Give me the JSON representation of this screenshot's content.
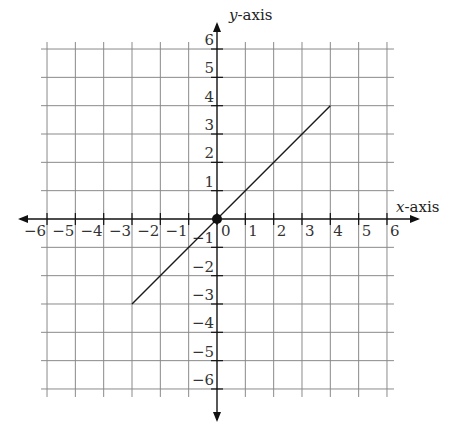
{
  "chart_data": {
    "type": "line",
    "title": "",
    "xlabel": "x-axis",
    "ylabel": "y-axis",
    "xlim": [
      -6,
      6
    ],
    "ylim": [
      -6,
      6
    ],
    "grid": true,
    "x_ticks": [
      -6,
      -5,
      -4,
      -3,
      -2,
      -1,
      0,
      1,
      2,
      3,
      4,
      5,
      6
    ],
    "y_ticks": [
      -6,
      -5,
      -4,
      -3,
      -2,
      -1,
      1,
      2,
      3,
      4,
      5,
      6
    ],
    "x_tick_labels": [
      "−6",
      "−5",
      "−4",
      "−3",
      "−2",
      "−1",
      "0",
      "1",
      "2",
      "3",
      "4",
      "5",
      "6"
    ],
    "y_tick_labels": [
      "−6",
      "−5",
      "−4",
      "−3",
      "−2",
      "−1",
      "1",
      "2",
      "3",
      "4",
      "5",
      "6"
    ],
    "series": [
      {
        "name": "line segment y = x",
        "x": [
          -3,
          4
        ],
        "y": [
          -3,
          4
        ]
      }
    ],
    "points": [
      {
        "label": "origin",
        "x": 0,
        "y": 0
      }
    ],
    "colors": {
      "line": "#1a1a1a",
      "grid": "#8a8a8a",
      "axis": "#111111"
    }
  }
}
